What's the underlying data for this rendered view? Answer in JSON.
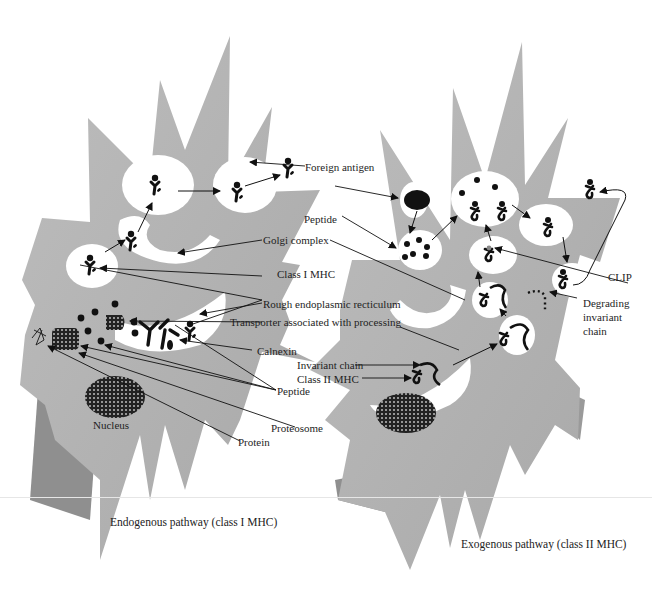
{
  "figure": {
    "left_panel": {
      "caption": "Endogenous pathway (class I MHC)",
      "labels": {
        "golgi": "Golgi complex",
        "class1": "Class I MHC",
        "rer": "Rough endoplasmic recticulum",
        "tap": "Transporter associated with processing",
        "calnexin": "Calnexin",
        "peptide": "Peptide",
        "proteosome": "Proteosome",
        "protein": "Protein",
        "nucleus": "Nucleus"
      }
    },
    "right_panel": {
      "caption": "Exogenous pathway (class II  MHC)",
      "labels": {
        "foreign_antigen": "Foreign antigen",
        "peptide": "Peptide",
        "clip": "CLIP",
        "degrading_1": "Degrading",
        "degrading_2": "invariant",
        "degrading_3": "chain",
        "invariant_chain": "Invariant chain",
        "class2": "Class II MHC"
      }
    },
    "colors": {
      "cell_fill": "#b4b4b4",
      "cell_shadow": "#8e8e8e",
      "vesicle": "#ffffff",
      "ink": "#111111"
    }
  }
}
